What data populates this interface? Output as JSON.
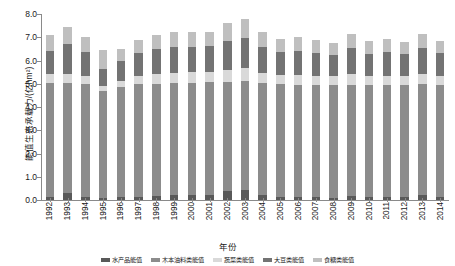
{
  "chart_data": {
    "type": "bar",
    "stacked": true,
    "title": "",
    "xlabel": "年份",
    "ylabel": "能值生态承载力/(亿hm²)",
    "ylim": [
      0.0,
      8.0
    ],
    "ytick_step": 1.0,
    "ytick_labels": [
      "8.0",
      "7.0",
      "6.0",
      "5.0",
      "4.0",
      "3.0",
      "2.0",
      "1.0",
      "0.0"
    ],
    "grid": false,
    "legend_position": "bottom",
    "categories": [
      "1992",
      "1993",
      "1994",
      "1995",
      "1996",
      "1997",
      "1998",
      "1999",
      "2000",
      "2001",
      "2002",
      "2003",
      "2004",
      "2005",
      "2006",
      "2007",
      "2008",
      "2009",
      "2010",
      "2011",
      "2012",
      "2013",
      "2014"
    ],
    "series": [
      {
        "name": "水产品能值",
        "color": "#595959",
        "values": [
          0.12,
          0.3,
          0.14,
          0.1,
          0.12,
          0.14,
          0.18,
          0.22,
          0.22,
          0.22,
          0.38,
          0.42,
          0.22,
          0.14,
          0.12,
          0.14,
          0.1,
          0.18,
          0.12,
          0.14,
          0.12,
          0.2,
          0.14
        ]
      },
      {
        "name": "木本油料类能值",
        "color": "#8c8c8c",
        "values": [
          4.9,
          4.72,
          4.84,
          4.58,
          4.72,
          4.86,
          4.82,
          4.8,
          4.82,
          4.84,
          4.7,
          4.7,
          4.8,
          4.84,
          4.82,
          4.8,
          4.86,
          4.78,
          4.82,
          4.8,
          4.84,
          4.78,
          4.82
        ]
      },
      {
        "name": "蔬菜类能值",
        "color": "#d9d9d9",
        "values": [
          0.38,
          0.42,
          0.34,
          0.22,
          0.28,
          0.34,
          0.4,
          0.44,
          0.46,
          0.46,
          0.52,
          0.56,
          0.46,
          0.4,
          0.42,
          0.4,
          0.36,
          0.44,
          0.38,
          0.4,
          0.36,
          0.44,
          0.38
        ]
      },
      {
        "name": "大豆类能值",
        "color": "#737373",
        "values": [
          1.02,
          1.26,
          1.06,
          0.74,
          0.86,
          0.98,
          1.08,
          1.12,
          1.1,
          1.1,
          1.26,
          1.3,
          1.12,
          1.0,
          1.04,
          1.0,
          0.92,
          1.12,
          0.98,
          1.02,
          0.94,
          1.1,
          0.98
        ]
      },
      {
        "name": "food-类能值",
        "color": "#bfbfbf",
        "values": [
          0.68,
          0.74,
          0.62,
          0.82,
          0.52,
          0.58,
          0.62,
          0.64,
          0.62,
          0.62,
          0.74,
          0.82,
          0.62,
          0.56,
          0.6,
          0.56,
          0.52,
          0.62,
          0.54,
          0.58,
          0.52,
          0.62,
          0.54
        ]
      }
    ],
    "totals": [
      7.1,
      7.44,
      7.0,
      6.46,
      6.5,
      6.9,
      7.1,
      7.22,
      7.22,
      7.24,
      7.6,
      7.8,
      7.22,
      6.94,
      7.0,
      6.9,
      6.76,
      7.14,
      6.84,
      6.94,
      6.78,
      7.14,
      6.86
    ]
  },
  "legend": {
    "items": [
      {
        "label": "水产品能值",
        "color": "#595959"
      },
      {
        "label": "木本油料类能值",
        "color": "#8c8c8c"
      },
      {
        "label": "蔬菜类能值",
        "color": "#d9d9d9"
      },
      {
        "label": "大豆类能值",
        "color": "#737373"
      },
      {
        "label": "食糖类能值",
        "color": "#bfbfbf"
      }
    ]
  },
  "axis": {
    "y_title": "能值生态承载力/(亿hm²)",
    "x_title": "年份"
  }
}
